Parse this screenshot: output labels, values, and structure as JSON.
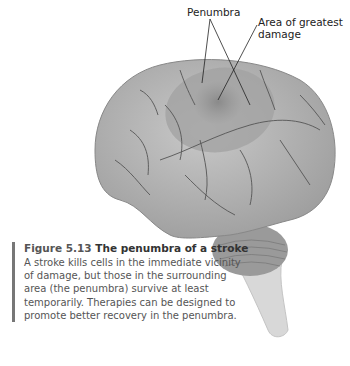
{
  "figure": {
    "labels": {
      "penumbra": "Penumbra",
      "area_of_greatest_damage": "Area of greatest damage"
    },
    "caption": {
      "number": "Figure 5.13",
      "title": "The penumbra of a stroke",
      "body": "A stroke kills cells in the immediate vicinity of damage, but those in the surrounding area (the penumbra) survive at least temporarily. Therapies can be designed to promote better recovery in the penumbra."
    },
    "colors": {
      "brain": "#b8b8b8",
      "penumbra": "#a5a5a5",
      "damage_core": "#8f8f8f",
      "caption_bar": "#777777"
    }
  }
}
